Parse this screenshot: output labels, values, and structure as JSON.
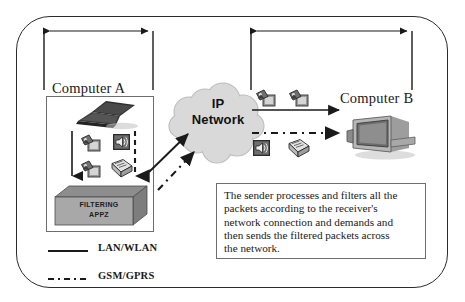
{
  "figure": {
    "type": "network-architecture-diagram",
    "background_color": "#ffffff",
    "line_color": "#1a1a1a",
    "frame_color": "#2b2b2b"
  },
  "brackets": [
    {
      "name": "computer-a-span",
      "label": ""
    },
    {
      "name": "computer-b-span",
      "label": ""
    }
  ],
  "nodes": {
    "computer_a": {
      "label": "Computer A",
      "device_icon": "laptop-icon",
      "contents": {
        "media_icons": [
          "image-file-icon",
          "image-file-icon",
          "audio-speaker-icon",
          "document-file-icon"
        ],
        "flow_arrows": [
          "solid-down-arrow",
          "dashed-down-arrow"
        ],
        "processor": {
          "line1": "FILTERING",
          "line2": "APPZ",
          "fill_color": "#a8a8a8",
          "top_face_color": "#8d8d8d",
          "side_face_color": "#7d7d7d"
        }
      }
    },
    "ip_network": {
      "line1": "IP",
      "line2": "Network",
      "shape": "cloud-shape",
      "fill_color": "#d9d9d9",
      "stroke_color": "#b4b4b4"
    },
    "computer_b": {
      "label": "Computer B",
      "device_icon": "desktop-computer-icon"
    }
  },
  "links": [
    {
      "name": "a-to-cloud-lan",
      "style": "solid",
      "icon": "arrow-up-right"
    },
    {
      "name": "a-to-cloud-gsm",
      "style": "dash-dot",
      "icon": "arrow-up-right"
    },
    {
      "name": "cloud-to-b-lan",
      "style": "solid",
      "icon": "arrow-right",
      "payload_icons": [
        "image-file-icon",
        "image-file-icon"
      ]
    },
    {
      "name": "cloud-to-b-gsm",
      "style": "dash-dot",
      "icon": "arrow-right",
      "payload_icons": [
        "audio-speaker-icon",
        "document-file-icon"
      ]
    }
  ],
  "note": {
    "lines": [
      "The sender processes and filters all the",
      "packets according to the receiver's",
      "network connection and demands and",
      "then sends the filtered packets across",
      "the network."
    ],
    "full_text": "The sender processes and filters all the packets according to the receiver's network connection and demands and then sends the filtered packets across the network."
  },
  "legend": {
    "items": [
      {
        "label": "LAN/WLAN",
        "style": "solid",
        "swatch": "solid-line-swatch"
      },
      {
        "label": "GSM/GPRS",
        "style": "dash-dot",
        "swatch": "dash-dot-line-swatch"
      }
    ]
  }
}
